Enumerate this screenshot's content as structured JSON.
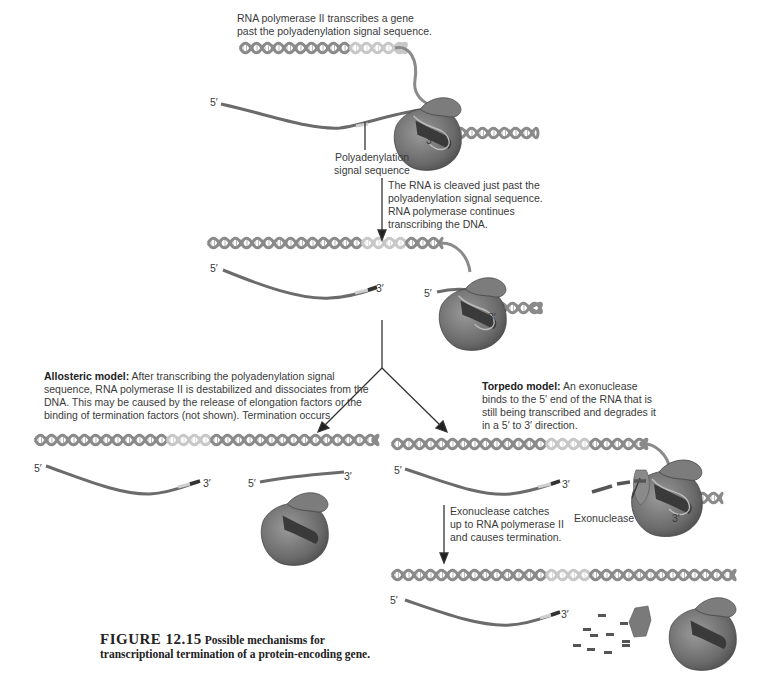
{
  "figure": {
    "number": "FIGURE 12.15",
    "caption": "Possible mechanisms for transcriptional termination of a protein-encoding gene."
  },
  "steps": {
    "step1": {
      "text": "RNA polymerase II transcribes a gene\npast the polyadenylation signal sequence."
    },
    "step2": {
      "text": "The RNA is cleaved just past the\npolyadenylation signal sequence.\nRNA polymerase continues\ntranscribing the DNA."
    },
    "allosteric": {
      "title": "Allosteric model:",
      "text": " After transcribing the polyadenylation signal sequence, RNA polymerase II is destabilized and dissociates from the DNA. This may be caused by the release of elongation factors or the binding of termination factors (not shown). Termination occurs."
    },
    "torpedo": {
      "title": "Torpedo model:",
      "text": " An exonuclease binds to the 5′ end of the RNA that is still being transcribed and degrades it in a 5′ to 3′ direction."
    },
    "torpedo_step2": {
      "text": "Exonuclease catches\nup to RNA polymerase II\nand causes termination."
    }
  },
  "labels": {
    "polyadenylation": "Polyadenylation\nsignal sequence",
    "exonuclease": "Exonuclease",
    "five_prime": "5′",
    "three_prime": "3′"
  },
  "colors": {
    "dna": "#8a8a8a",
    "dna_signal": "#c8c8c8",
    "rna": "#6b6b6b",
    "rna_signal": "#cfcfcf",
    "polymerase": "#6e6e6e",
    "polymerase_dark": "#3a3a3a"
  }
}
